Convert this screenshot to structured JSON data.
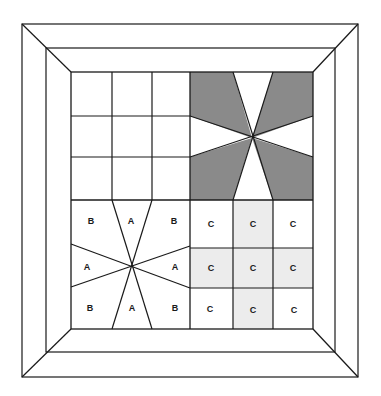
{
  "diagram": {
    "type": "quilt-block-layout",
    "colors": {
      "line": "#1a1a1a",
      "background": "#ffffff",
      "dark_shade": "#8a8a8a",
      "light_shade": "#ececec"
    },
    "frame": {
      "outer": [
        22,
        24,
        358,
        377
      ],
      "middle": [
        46,
        48,
        335,
        352
      ],
      "inner": [
        71,
        72,
        313,
        329
      ]
    },
    "quadrants": {
      "top_left": {
        "pattern": "3x3 grid",
        "labels": []
      },
      "top_right": {
        "pattern": "8-wedge star, dark shaded",
        "labels": []
      },
      "bottom_left": {
        "pattern": "8-wedge star",
        "labels": {
          "top_left": "B",
          "top": "A",
          "top_right": "B",
          "left": "A",
          "right": "A",
          "bottom_left": "B",
          "bottom": "A",
          "bottom_right": "B"
        }
      },
      "bottom_right": {
        "pattern": "3x3 grid, light shaded cross",
        "labels": [
          [
            "C",
            "C",
            "C"
          ],
          [
            "C",
            "C",
            "C"
          ],
          [
            "C",
            "C",
            "C"
          ]
        ]
      }
    }
  }
}
